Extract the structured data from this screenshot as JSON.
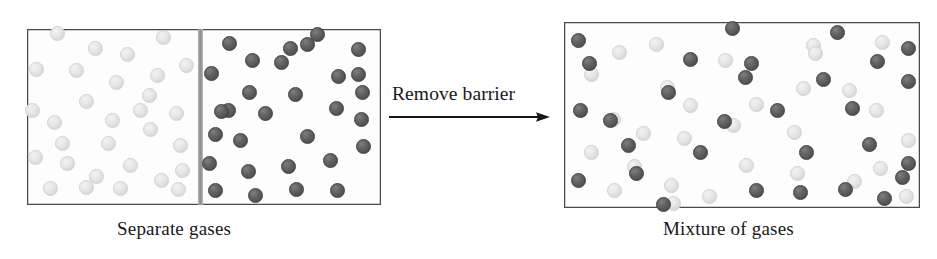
{
  "figure": {
    "type": "diagram",
    "background_color": "#ffffff"
  },
  "left_panel": {
    "caption": "Separate gases",
    "box": {
      "x": 27,
      "y": 29,
      "width": 354,
      "height": 176,
      "border_color": "#4a4a4a",
      "fill_color": "#fdfdfd"
    },
    "barrier": {
      "label": "barrier",
      "x": 198,
      "y": 29,
      "width": 5,
      "height": 176,
      "color": "#8d8d8d"
    },
    "compartments": [
      {
        "name": "left-compartment",
        "particle_color": "#e3e3e3",
        "particle_label": "light gas particle",
        "count": 30,
        "particles": [
          [
            57,
            33
          ],
          [
            95,
            48
          ],
          [
            127,
            54
          ],
          [
            163,
            37
          ],
          [
            36,
            69
          ],
          [
            76,
            70
          ],
          [
            116,
            82
          ],
          [
            157,
            75
          ],
          [
            186,
            65
          ],
          [
            32,
            110
          ],
          [
            86,
            101
          ],
          [
            140,
            110
          ],
          [
            150,
            129
          ],
          [
            176,
            113
          ],
          [
            54,
            122
          ],
          [
            108,
            143
          ],
          [
            180,
            145
          ],
          [
            35,
            157
          ],
          [
            67,
            163
          ],
          [
            96,
            176
          ],
          [
            130,
            165
          ],
          [
            161,
            180
          ],
          [
            50,
            188
          ],
          [
            86,
            187
          ],
          [
            120,
            188
          ],
          [
            178,
            189
          ],
          [
            149,
            95
          ],
          [
            62,
            143
          ],
          [
            112,
            120
          ],
          [
            182,
            170
          ]
        ]
      },
      {
        "name": "right-compartment",
        "particle_color": "#595959",
        "particle_label": "dark gas particle",
        "count": 30,
        "particles": [
          [
            229,
            43
          ],
          [
            252,
            60
          ],
          [
            290,
            48
          ],
          [
            317,
            34
          ],
          [
            358,
            49
          ],
          [
            211,
            73
          ],
          [
            249,
            92
          ],
          [
            295,
            94
          ],
          [
            358,
            74
          ],
          [
            215,
            134
          ],
          [
            228,
            110
          ],
          [
            265,
            113
          ],
          [
            307,
            136
          ],
          [
            336,
            108
          ],
          [
            361,
            119
          ],
          [
            240,
            140
          ],
          [
            209,
            163
          ],
          [
            248,
            171
          ],
          [
            288,
            166
          ],
          [
            330,
            160
          ],
          [
            215,
            190
          ],
          [
            255,
            195
          ],
          [
            296,
            189
          ],
          [
            337,
            190
          ],
          [
            363,
            146
          ],
          [
            281,
            62
          ],
          [
            338,
            76
          ],
          [
            362,
            92
          ],
          [
            221,
            111
          ],
          [
            307,
            44
          ]
        ]
      }
    ]
  },
  "transition": {
    "label": "Remove barrier",
    "arrow": {
      "name": "right-arrow",
      "from_x": 390,
      "to_x": 548,
      "y": 117,
      "color": "#17171a"
    }
  },
  "right_panel": {
    "caption": "Mixture of gases",
    "box": {
      "x": 564,
      "y": 22,
      "width": 356,
      "height": 186,
      "border_color": "#4a4a4a",
      "fill_color": "#fdfdfd"
    },
    "particle_colors": {
      "light": "#e3e3e3",
      "dark": "#595959"
    },
    "particles_light": [
      [
        619,
        52
      ],
      [
        591,
        74
      ],
      [
        656,
        44
      ],
      [
        813,
        45
      ],
      [
        815,
        53
      ],
      [
        667,
        87
      ],
      [
        690,
        105
      ],
      [
        684,
        138
      ],
      [
        882,
        42
      ],
      [
        591,
        152
      ],
      [
        643,
        133
      ],
      [
        733,
        125
      ],
      [
        794,
        132
      ],
      [
        849,
        90
      ],
      [
        876,
        110
      ],
      [
        756,
        104
      ],
      [
        614,
        190
      ],
      [
        671,
        185
      ],
      [
        673,
        203
      ],
      [
        709,
        196
      ],
      [
        797,
        173
      ],
      [
        854,
        181
      ],
      [
        906,
        196
      ],
      [
        908,
        140
      ],
      [
        803,
        88
      ],
      [
        613,
        119
      ],
      [
        746,
        165
      ],
      [
        880,
        168
      ],
      [
        725,
        60
      ],
      [
        634,
        166
      ]
    ],
    "particles_dark": [
      [
        578,
        40
      ],
      [
        690,
        59
      ],
      [
        668,
        92
      ],
      [
        732,
        28
      ],
      [
        751,
        63
      ],
      [
        837,
        32
      ],
      [
        877,
        61
      ],
      [
        908,
        48
      ],
      [
        580,
        110
      ],
      [
        610,
        120
      ],
      [
        724,
        121
      ],
      [
        745,
        77
      ],
      [
        823,
        79
      ],
      [
        908,
        81
      ],
      [
        852,
        108
      ],
      [
        628,
        145
      ],
      [
        700,
        152
      ],
      [
        777,
        110
      ],
      [
        806,
        152
      ],
      [
        869,
        144
      ],
      [
        908,
        163
      ],
      [
        578,
        180
      ],
      [
        636,
        173
      ],
      [
        756,
        190
      ],
      [
        800,
        192
      ],
      [
        845,
        189
      ],
      [
        902,
        177
      ],
      [
        589,
        63
      ],
      [
        663,
        204
      ],
      [
        884,
        198
      ]
    ]
  }
}
